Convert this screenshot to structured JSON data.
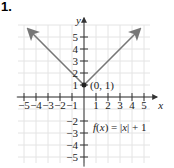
{
  "problem_number": "1.",
  "chart_data": {
    "type": "line",
    "title": "",
    "function_label": "f(x) = |x| + 1",
    "xlabel": "x",
    "ylabel": "y",
    "xlim": [
      -5.5,
      6
    ],
    "ylim": [
      -5.5,
      6.5
    ],
    "grid": true,
    "x_ticks": [
      -5,
      -4,
      -3,
      -2,
      -1,
      1,
      2,
      3,
      4,
      5
    ],
    "x_tick_labels": [
      "−5",
      "−4",
      "−3",
      "−2",
      "−1",
      "1",
      "2",
      "3",
      "4",
      "5"
    ],
    "y_ticks": [
      -5,
      -4,
      -3,
      -2,
      1,
      2,
      3,
      4,
      5
    ],
    "y_tick_labels": [
      "−5",
      "−4",
      "−3",
      "−2",
      "1",
      "2",
      "3",
      "4",
      "5"
    ],
    "series": [
      {
        "name": "f(x) = |x| + 1",
        "x": [
          -4.6,
          0,
          4.6
        ],
        "y": [
          5.6,
          1,
          5.6
        ],
        "arrows_at_ends": true,
        "color": "#777777"
      }
    ],
    "annotations": [
      {
        "text": "(0, 1)",
        "x": 0,
        "y": 1,
        "marker": "point"
      }
    ]
  }
}
